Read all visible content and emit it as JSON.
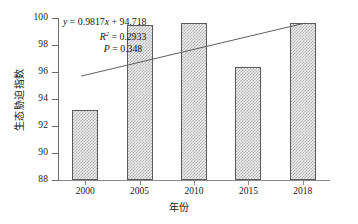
{
  "chart_data": {
    "type": "bar",
    "title": "",
    "xlabel": "年份",
    "ylabel": "生态胁迫指数",
    "categories": [
      "2000",
      "2005",
      "2010",
      "2015",
      "2018"
    ],
    "values": [
      93.2,
      99.5,
      99.65,
      96.4,
      99.65
    ],
    "ylim": [
      88,
      100
    ],
    "yticks": [
      "88",
      "90",
      "92",
      "94",
      "96",
      "98",
      "100"
    ],
    "ytick_values": [
      88,
      90,
      92,
      94,
      96,
      98,
      100
    ],
    "grid": false,
    "legend": false,
    "series": [
      {
        "name": "生态胁迫指数",
        "values": [
          93.2,
          99.5,
          99.65,
          96.4,
          99.65
        ]
      }
    ],
    "trendline": {
      "type": "line",
      "equation": "y = 0.9817x + 94.718",
      "slope": 0.9817,
      "intercept": 94.718,
      "r_squared": 0.2933,
      "p_value": 0.348,
      "start_value": 95.7,
      "end_value": 99.62
    },
    "annotations": {
      "equation_y": "y",
      "equation_eq": " = 0.9817",
      "equation_x": "x",
      "equation_tail": " + 94.718",
      "r_label": "R",
      "r_sup": "2",
      "r_value": " = 0.2933",
      "p_label": "P",
      "p_value": " = 0.348"
    },
    "style": {
      "bar_fill": "#e9e9e9",
      "bar_pattern": "#b8b8b8",
      "bar_border": "#5a5a5a",
      "axis_color": "#6b6b6b",
      "text_color": "#1a1a1a",
      "trend_color": "#5f5f5f",
      "background": "#ffffff"
    }
  }
}
